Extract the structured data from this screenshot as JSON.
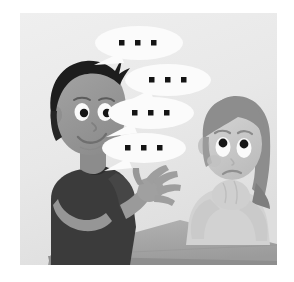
{
  "scene": {
    "title": "Two cartoon children at a table, one speaking with repeated ellipsis speech bubbles",
    "style": "grayscale cartoon illustration",
    "background_color": "#e9e9e9",
    "canvas": {
      "width": 294,
      "height": 282
    },
    "frame": {
      "left": 20,
      "top": 13,
      "width": 257,
      "height": 252,
      "matte_color": "#ffffff"
    }
  },
  "speech_bubbles": [
    {
      "id": "bubble-1",
      "text": "...",
      "dots": 3,
      "cx": 139,
      "cy": 43,
      "rx": 44,
      "ry": 17,
      "tail_x": 108,
      "tail_y": 58,
      "fill": "#fbfbfb"
    },
    {
      "id": "bubble-2",
      "text": "...",
      "dots": 3,
      "cx": 168,
      "cy": 80,
      "rx": 43,
      "ry": 16,
      "tail_x": 139,
      "tail_y": 94,
      "fill": "#fbfbfb"
    },
    {
      "id": "bubble-3",
      "text": "...",
      "dots": 3,
      "cx": 151,
      "cy": 113,
      "rx": 43,
      "ry": 16,
      "tail_x": 124,
      "tail_y": 127,
      "fill": "#fbfbfb"
    },
    {
      "id": "bubble-4",
      "text": "...",
      "dots": 3,
      "cx": 144,
      "cy": 148,
      "rx": 42,
      "ry": 15,
      "tail_x": 120,
      "tail_y": 161,
      "fill": "#fbfbfb"
    }
  ],
  "characters": {
    "boy": {
      "name": "boy-speaking",
      "expression": "smiling",
      "hair_color": "#1d1d1d",
      "skin_color": "#9a9a9a",
      "shirt_color": "#3b3b3b",
      "gesture": "open-hand-raised",
      "position": "left"
    },
    "girl": {
      "name": "girl-listening",
      "expression": "confused-worried",
      "hair_color": "#8f8f8f",
      "skin_color": "#c8c8c8",
      "shirt_color": "#cfcfcf",
      "gesture": "chin-resting-on-hands",
      "position": "right"
    }
  },
  "objects": {
    "table": {
      "name": "table",
      "top_color": "#a8a8a8",
      "edge_color": "#8c8c8c"
    }
  },
  "palette": {
    "background": "#e9e9e9",
    "bubble_fill": "#fbfbfb",
    "bubble_shadow": "#dcdcdc",
    "dot_color": "#141414",
    "dark_hair": "#1d1d1d",
    "shirt_dark": "#3b3b3b",
    "boy_skin": "#9a9a9a",
    "girl_skin": "#c8c8c8",
    "table_top": "#a8a8a8",
    "matte": "#ffffff"
  }
}
